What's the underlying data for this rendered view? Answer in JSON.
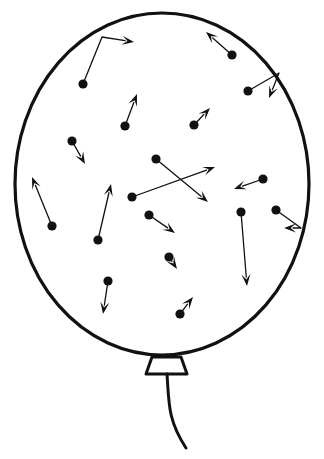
{
  "figure": {
    "title": "Gas particles in a balloon",
    "background_color": "#ffffff",
    "ink_color": "#111111"
  },
  "balloon": {
    "name": "balloon-body",
    "shape": "ellipse",
    "center_x": 162,
    "center_y": 184,
    "radius_x": 147,
    "radius_y": 171,
    "outline_color": "#111111",
    "outline_width": 3.2,
    "fill_color": "#ffffff",
    "neck": {
      "name": "balloon-neck-knot",
      "shape": "trapezoid",
      "top_left_x": 152,
      "top_right_x": 181,
      "top_y": 357,
      "bottom_left_x": 146,
      "bottom_right_x": 187,
      "bottom_y": 374,
      "stroke_width": 3.0
    },
    "string": {
      "name": "balloon-string",
      "start_x": 167,
      "start_y": 374,
      "end_x": 186,
      "end_y": 448,
      "stroke_width": 3.0
    }
  },
  "particles": {
    "count": 18,
    "dot_radius": 4.6,
    "dot_color": "#111111",
    "vector_color": "#111111",
    "vector_width": 1.3,
    "arrow_head_length": 12,
    "arrow_head_width": 9,
    "items": [
      {
        "id": "particle-1",
        "label": "upper-left particle with bent rebound vector",
        "dot_x": 83,
        "dot_y": 84,
        "path": [
          [
            83,
            84
          ],
          [
            102,
            37
          ],
          [
            134,
            42
          ]
        ],
        "bounce": true,
        "arrow_angle_deg": 8
      },
      {
        "id": "particle-2",
        "label": "upper-middle particle moving up",
        "dot_x": 125,
        "dot_y": 126,
        "path": [
          [
            125,
            126
          ],
          [
            137,
            94
          ]
        ],
        "bounce": false,
        "arrow_angle_deg": -69
      },
      {
        "id": "particle-3",
        "label": "upper-right particle moving up-left",
        "dot_x": 232,
        "dot_y": 55,
        "path": [
          [
            232,
            55
          ],
          [
            206,
            32
          ]
        ],
        "bounce": false,
        "arrow_angle_deg": -139
      },
      {
        "id": "particle-4",
        "label": "right particle rebounding off wall downward",
        "dot_x": 248,
        "dot_y": 91,
        "path": [
          [
            248,
            91
          ],
          [
            279,
            73
          ],
          [
            269,
            98
          ]
        ],
        "bounce": true,
        "arrow_angle_deg": 112
      },
      {
        "id": "particle-5",
        "label": "middle-right particle moving up-right",
        "dot_x": 194,
        "dot_y": 125,
        "path": [
          [
            194,
            125
          ],
          [
            210,
            108
          ]
        ],
        "bounce": false,
        "arrow_angle_deg": -47
      },
      {
        "id": "particle-6",
        "label": "left-upper particle moving down-right",
        "dot_x": 72,
        "dot_y": 141,
        "path": [
          [
            72,
            141
          ],
          [
            85,
            164
          ]
        ],
        "bounce": false,
        "arrow_angle_deg": 61
      },
      {
        "id": "particle-7",
        "label": "center particle moving down-right across",
        "dot_x": 156,
        "dot_y": 159,
        "path": [
          [
            156,
            159
          ],
          [
            208,
            202
          ]
        ],
        "bounce": false,
        "arrow_angle_deg": 40
      },
      {
        "id": "particle-8",
        "label": "center-left particle moving up-right across",
        "dot_x": 132,
        "dot_y": 197,
        "path": [
          [
            132,
            197
          ],
          [
            215,
            167
          ]
        ],
        "bounce": false,
        "arrow_angle_deg": -20
      },
      {
        "id": "particle-9",
        "label": "lower-left particle moving up-left",
        "dot_x": 52,
        "dot_y": 226,
        "path": [
          [
            52,
            226
          ],
          [
            32,
            177
          ]
        ],
        "bounce": false,
        "arrow_angle_deg": -112
      },
      {
        "id": "particle-10",
        "label": "left-center particle moving up",
        "dot_x": 98,
        "dot_y": 240,
        "path": [
          [
            98,
            240
          ],
          [
            111,
            184
          ]
        ],
        "bounce": false,
        "arrow_angle_deg": -77
      },
      {
        "id": "particle-11",
        "label": "center-low particle moving down-right",
        "dot_x": 149,
        "dot_y": 215,
        "path": [
          [
            149,
            215
          ],
          [
            175,
            233
          ]
        ],
        "bounce": false,
        "arrow_angle_deg": 35
      },
      {
        "id": "particle-12",
        "label": "right particle moving left",
        "dot_x": 263,
        "dot_y": 179,
        "path": [
          [
            263,
            179
          ],
          [
            234,
            189
          ]
        ],
        "bounce": false,
        "arrow_angle_deg": 161
      },
      {
        "id": "particle-13",
        "label": "right particle rebounding off wall leftward",
        "dot_x": 276,
        "dot_y": 210,
        "path": [
          [
            276,
            210
          ],
          [
            301,
            228
          ],
          [
            284,
            228
          ]
        ],
        "bounce": true,
        "arrow_angle_deg": 180
      },
      {
        "id": "particle-14",
        "label": "right-center particle moving straight down",
        "dot_x": 241,
        "dot_y": 212,
        "path": [
          [
            241,
            212
          ],
          [
            247,
            286
          ]
        ],
        "bounce": false,
        "arrow_angle_deg": 85
      },
      {
        "id": "particle-15",
        "label": "center particle with very short down-right vector",
        "dot_x": 169,
        "dot_y": 257,
        "path": [
          [
            169,
            257
          ],
          [
            177,
            269
          ]
        ],
        "bounce": false,
        "arrow_angle_deg": 56
      },
      {
        "id": "particle-16",
        "label": "lower-left particle moving down",
        "dot_x": 108,
        "dot_y": 281,
        "path": [
          [
            108,
            281
          ],
          [
            103,
            314
          ]
        ],
        "bounce": false,
        "arrow_angle_deg": 99
      },
      {
        "id": "particle-17",
        "label": "lower-right particle moving up-right",
        "dot_x": 180,
        "dot_y": 314,
        "path": [
          [
            180,
            314
          ],
          [
            193,
            297
          ]
        ],
        "bounce": false,
        "arrow_angle_deg": -52
      },
      {
        "id": "particle-18",
        "label": "upper-left small particle near wall",
        "dot_x": 250,
        "dot_y": 91,
        "path": [
          [
            250,
            91
          ],
          [
            250,
            91
          ]
        ],
        "bounce": false,
        "arrow_angle_deg": 0,
        "hidden": true
      }
    ]
  }
}
